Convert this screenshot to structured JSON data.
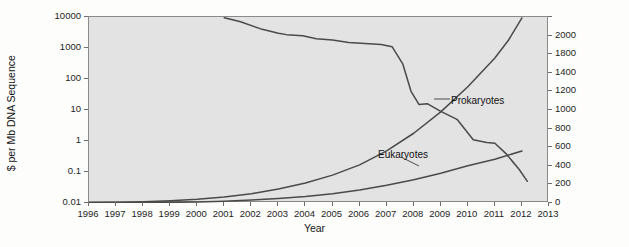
{
  "chart_data": {
    "type": "line",
    "title": "",
    "xlabel": "Year",
    "ylabel_left": "$ per Mb DNA Sequence",
    "ylabel_right": "Sequenced Genomes",
    "grid": false,
    "legend_position": "inline-annotations",
    "x_ticks": [
      "1996",
      "1997",
      "1998",
      "1999",
      "2000",
      "2001",
      "2002",
      "2003",
      "2004",
      "2005",
      "2006",
      "2007",
      "2008",
      "2009",
      "2010",
      "2011",
      "2012",
      "2013"
    ],
    "xlim": [
      1996,
      2013
    ],
    "y_left_scale": "log",
    "y_left_ticks": [
      "0.01",
      "0.1",
      "1",
      "10",
      "100",
      "1000",
      "10000"
    ],
    "ylim_left": [
      0.01,
      10000
    ],
    "y_right_ticks": [
      "0",
      "200",
      "400",
      "600",
      "800",
      "1000",
      "1200",
      "1400",
      "1800",
      "2000"
    ],
    "ylim_right": [
      0,
      2000
    ],
    "series": [
      {
        "name": "Cost per Mb DNA Sequence",
        "axis": "left",
        "annotation": "",
        "x": [
          2001.0,
          2001.6,
          2002.4,
          2003.0,
          2003.3,
          2003.9,
          2004.4,
          2005.0,
          2005.6,
          2006.2,
          2006.8,
          2007.2,
          2007.6,
          2007.9,
          2008.2,
          2008.5,
          2009.0,
          2009.6,
          2010.2,
          2010.7,
          2011.0,
          2011.4,
          2011.9,
          2012.2
        ],
        "y": [
          9500,
          7000,
          4000,
          3000,
          2700,
          2500,
          2000,
          1800,
          1500,
          1400,
          1300,
          1100,
          300,
          40,
          15,
          16,
          9,
          5,
          1.1,
          0.9,
          0.85,
          0.4,
          0.12,
          0.05
        ]
      },
      {
        "name": "Prokaryotes",
        "axis": "right",
        "annotation": "Prokaryotes",
        "x": [
          1996.0,
          1997.0,
          1998.0,
          1999.0,
          2000.0,
          2001.0,
          2002.0,
          2003.0,
          2004.0,
          2005.0,
          2006.0,
          2007.0,
          2008.0,
          2009.0,
          2010.0,
          2011.0,
          2011.5,
          2012.0
        ],
        "y": [
          2,
          6,
          14,
          25,
          40,
          65,
          100,
          150,
          215,
          300,
          410,
          560,
          750,
          980,
          1250,
          1560,
          1750,
          1990
        ]
      },
      {
        "name": "Eukaryotes",
        "axis": "right",
        "annotation": "Eukaryotes",
        "x": [
          1996.0,
          1997.0,
          1998.0,
          1999.0,
          2000.0,
          2001.0,
          2002.0,
          2003.0,
          2004.0,
          2005.0,
          2006.0,
          2007.0,
          2008.0,
          2009.0,
          2010.0,
          2011.0,
          2012.0
        ],
        "y": [
          1,
          2,
          4,
          7,
          12,
          20,
          32,
          48,
          70,
          100,
          140,
          190,
          250,
          320,
          400,
          470,
          560
        ]
      }
    ]
  }
}
